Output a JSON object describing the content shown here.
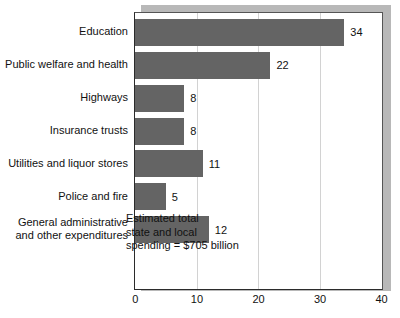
{
  "chart_data": {
    "type": "bar",
    "orientation": "horizontal",
    "title": "",
    "xlabel": "",
    "ylabel": "",
    "xlim": [
      0,
      40
    ],
    "xticks": [
      0,
      10,
      20,
      30,
      40
    ],
    "xtick_labels": [
      "0",
      "10",
      "20",
      "30",
      "40"
    ],
    "grid": true,
    "grid_axis": "x",
    "legend": false,
    "categories": [
      "Education",
      "Public welfare and health",
      "Highways",
      "Insurance trusts",
      "Utilities and liquor stores",
      "Police and fire",
      "General administrative and other expenditures"
    ],
    "category_lines": [
      [
        "Education"
      ],
      [
        "Public welfare and health"
      ],
      [
        "Highways"
      ],
      [
        "Insurance trusts"
      ],
      [
        "Utilities and liquor stores"
      ],
      [
        "Police and fire"
      ],
      [
        "General administrative",
        "and other expenditures"
      ]
    ],
    "values": [
      34,
      22,
      8,
      8,
      11,
      5,
      12
    ],
    "value_labels": [
      "34",
      "22",
      "8",
      "8",
      "11",
      "5",
      "12"
    ],
    "annotations": [
      {
        "lines": [
          "Estimated total",
          "state and local",
          "spending = $705 billion"
        ]
      }
    ],
    "colors": {
      "bar": "#646464",
      "text": "#111111",
      "grid": "#d2d2d2",
      "axis": "#2b2b2b",
      "shadow": "#b8b8b8",
      "background": "#ffffff"
    }
  }
}
